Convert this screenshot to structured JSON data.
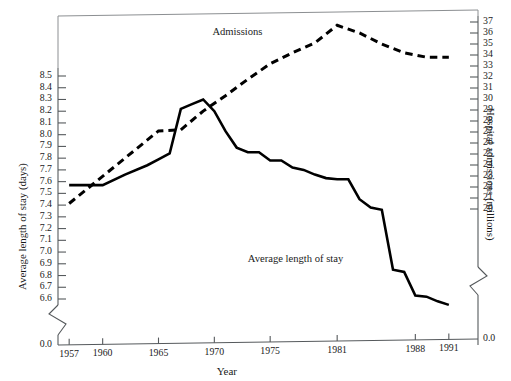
{
  "chart_data": {
    "type": "line",
    "title": "",
    "xlabel": "Year",
    "ylabel": "Average length of stay (days)",
    "y2label": "Hospital admissions (millions)",
    "grid": false,
    "legend_position": "inline-annotations",
    "xlim": [
      1956,
      1992
    ],
    "x_ticks": [
      "1957",
      "1960",
      "1965",
      "1970",
      "1975",
      "1981",
      "1988",
      "1991"
    ],
    "x_tick_values": [
      1957,
      1960,
      1965,
      1970,
      1975,
      1981,
      1988,
      1991
    ],
    "ylim": [
      6.6,
      8.5
    ],
    "y_ticks": [
      "8.5",
      "8.4",
      "8.3",
      "8.2",
      "8.1",
      "8.0",
      "7.9",
      "7.8",
      "7.7",
      "7.6",
      "7.5",
      "7.4",
      "7.3",
      "7.2",
      "7.1",
      "7.0",
      "6.9",
      "6.8",
      "6.7",
      "6.6"
    ],
    "y_axis_break_label": "0.0",
    "y2lim": [
      20,
      37
    ],
    "y2_ticks": [
      "37",
      "36",
      "35",
      "34",
      "33",
      "32",
      "31",
      "30",
      "29",
      "28",
      "27",
      "26",
      "25",
      "24",
      "23",
      "22",
      "21",
      "20"
    ],
    "y2_axis_break_label": "0.0",
    "annotations": [
      {
        "name": "admissions-label",
        "text": "Admissions",
        "x": 1971.8,
        "y_axis": "right",
        "value": 36.0
      },
      {
        "name": "length-of-stay-label",
        "text": "Average length of stay",
        "x": 1977.0,
        "y_axis": "left",
        "value": 6.93
      }
    ],
    "series": [
      {
        "name": "Average length of stay",
        "axis": "left",
        "style": "solid",
        "units": "days",
        "x": [
          1957,
          1960,
          1962,
          1964,
          1965,
          1966,
          1967,
          1968,
          1969,
          1970,
          1971,
          1972,
          1973,
          1974,
          1975,
          1976,
          1977,
          1978,
          1979,
          1980,
          1981,
          1982,
          1983,
          1984,
          1985,
          1986,
          1987,
          1988,
          1989,
          1990,
          1991
        ],
        "values": [
          7.57,
          7.57,
          7.66,
          7.74,
          7.79,
          7.84,
          8.22,
          8.26,
          8.3,
          8.2,
          8.03,
          7.89,
          7.85,
          7.85,
          7.78,
          7.78,
          7.72,
          7.7,
          7.66,
          7.63,
          7.62,
          7.62,
          7.45,
          7.38,
          7.36,
          6.85,
          6.83,
          6.63,
          6.62,
          6.58,
          6.55
        ]
      },
      {
        "name": "Admissions",
        "axis": "right",
        "style": "dashed",
        "units": "millions",
        "x": [
          1957,
          1965,
          1967,
          1969,
          1971,
          1973,
          1975,
          1977,
          1979,
          1981,
          1983,
          1985,
          1987,
          1989,
          1991
        ],
        "values": [
          20.5,
          27.1,
          27.2,
          28.9,
          30.3,
          31.8,
          33.2,
          34.2,
          35.1,
          36.7,
          36.0,
          35.0,
          34.2,
          33.8,
          33.8
        ]
      }
    ]
  },
  "colors": {
    "series_line": "#000000",
    "axis": "#55595c",
    "background": "#ffffff",
    "text": "#1a1a1a"
  }
}
